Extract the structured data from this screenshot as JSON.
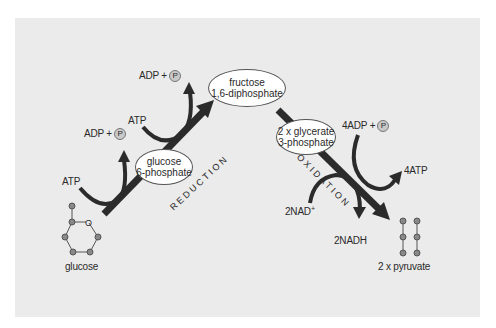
{
  "diagram": {
    "colors": {
      "panel_bg": "#ebebeb",
      "arrow": "#2b2b2b",
      "phosphate_circle": "#c9c9c9",
      "ellipse_fill": "#ffffff"
    },
    "nodes": {
      "glucose": "glucose",
      "glucose_6_phosphate": [
        "glucose",
        "6-phosphate"
      ],
      "fructose_diphosphate": [
        "fructose",
        "1,6-diphosphate"
      ],
      "glycerate_3_phosphate": [
        "2 x glycerate",
        "3-phosphate"
      ],
      "pyruvate": "2 x pyruvate"
    },
    "phases": {
      "reduction": "REDUCTION",
      "oxidation": "OXIDATION"
    },
    "inputs_outputs": {
      "atp_1": "ATP",
      "adp_1": "ADP +",
      "atp_2": "ATP",
      "adp_2": "ADP +",
      "adp_4": "4ADP +",
      "atp_4": "4ATP",
      "nad": "2NAD",
      "nad_sup": "+",
      "nadh": "2NADH",
      "phosphate_symbol": "P"
    }
  }
}
